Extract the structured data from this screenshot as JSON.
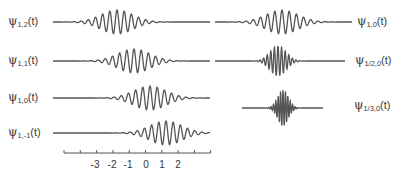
{
  "figure": {
    "stroke_color": "#555555",
    "left_column": [
      {
        "label_main": "ψ",
        "label_sub": "1,2",
        "label_tail": "(t)",
        "scale": 1,
        "shift": 2,
        "y": 22,
        "center_x": 117
      },
      {
        "label_main": "ψ",
        "label_sub": "1,1",
        "label_tail": "(t)",
        "scale": 1,
        "shift": 1,
        "y": 61,
        "center_x": 134
      },
      {
        "label_main": "ψ",
        "label_sub": "1,0",
        "label_tail": "(t)",
        "scale": 1,
        "shift": 0,
        "y": 98,
        "center_x": 150
      },
      {
        "label_main": "ψ",
        "label_sub": "1,-1",
        "label_tail": "(t)",
        "scale": 1,
        "shift": -1,
        "y": 133,
        "center_x": 166
      }
    ],
    "right_column": [
      {
        "label_main": "ψ",
        "label_sub": "1,0",
        "label_tail": "(t)",
        "scale": 1,
        "shift": 0,
        "y": 22,
        "center_x": 282
      },
      {
        "label_main": "ψ",
        "label_sub": "1/2,0",
        "label_tail": "(t)",
        "scale": 0.5,
        "shift": 0,
        "y": 61,
        "center_x": 278
      },
      {
        "label_main": "ψ",
        "label_sub": "1/3,0",
        "label_tail": "(t)",
        "scale": 0.333,
        "shift": 0,
        "y": 108,
        "center_x": 283
      }
    ],
    "axis": {
      "tick_labels": [
        "-3",
        "-2",
        "-1",
        "0",
        "1",
        "2"
      ],
      "y": 153
    }
  }
}
